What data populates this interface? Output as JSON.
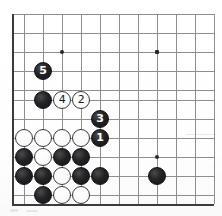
{
  "diagram": {
    "kind": "go-board-diagram",
    "board": {
      "origin_x": 12,
      "origin_y": 14,
      "spacing": 19,
      "cols": 11,
      "rows": 10,
      "left_edge_x": 12,
      "bottom_edge_y": 204,
      "line_color": "#8d8d92",
      "edge_color": "#3b3b3e"
    },
    "star_points": [
      {
        "name": "star-point-upper-left",
        "x": 62,
        "y": 52
      },
      {
        "name": "star-point-upper-right",
        "x": 157,
        "y": 52
      },
      {
        "name": "star-point-lower-right",
        "x": 157,
        "y": 157
      }
    ],
    "grid_lines_h": [
      14,
      33,
      52,
      71,
      90,
      100,
      119,
      138,
      157,
      176,
      195,
      204
    ],
    "grid_lines_v": [
      12,
      24,
      43,
      62,
      81,
      100,
      119,
      138,
      157,
      176,
      195,
      214
    ],
    "numbered_moves": [
      {
        "number": "1",
        "color": "black",
        "x": 100,
        "y": 138,
        "name": "move-1-black"
      },
      {
        "number": "2",
        "color": "white",
        "x": 81,
        "y": 100,
        "name": "move-2-white"
      },
      {
        "number": "3",
        "color": "black",
        "x": 100,
        "y": 119,
        "name": "move-3-black"
      },
      {
        "number": "4",
        "color": "white",
        "x": 62,
        "y": 100,
        "name": "move-4-white"
      },
      {
        "number": "5",
        "color": "black",
        "x": 43,
        "y": 71,
        "name": "move-5-black"
      }
    ],
    "stones": [
      {
        "color": "black",
        "x": 43,
        "y": 100,
        "name": "black-stone"
      },
      {
        "color": "white",
        "x": 24,
        "y": 138,
        "name": "white-stone"
      },
      {
        "color": "white",
        "x": 43,
        "y": 138,
        "name": "white-stone"
      },
      {
        "color": "white",
        "x": 62,
        "y": 138,
        "name": "white-stone"
      },
      {
        "color": "white",
        "x": 81,
        "y": 138,
        "name": "white-stone"
      },
      {
        "color": "black",
        "x": 24,
        "y": 157,
        "name": "black-stone"
      },
      {
        "color": "white",
        "x": 43,
        "y": 157,
        "name": "white-stone"
      },
      {
        "color": "black",
        "x": 62,
        "y": 157,
        "name": "black-stone"
      },
      {
        "color": "black",
        "x": 81,
        "y": 157,
        "name": "black-stone"
      },
      {
        "color": "black",
        "x": 24,
        "y": 176,
        "name": "black-stone"
      },
      {
        "color": "black",
        "x": 43,
        "y": 176,
        "name": "black-stone"
      },
      {
        "color": "white",
        "x": 62,
        "y": 176,
        "name": "white-stone"
      },
      {
        "color": "black",
        "x": 81,
        "y": 176,
        "name": "black-stone"
      },
      {
        "color": "black",
        "x": 100,
        "y": 176,
        "name": "black-stone"
      },
      {
        "color": "black",
        "x": 43,
        "y": 195,
        "name": "black-stone"
      },
      {
        "color": "white",
        "x": 62,
        "y": 195,
        "name": "white-stone"
      },
      {
        "color": "white",
        "x": 81,
        "y": 195,
        "name": "white-stone"
      },
      {
        "color": "black",
        "x": 157,
        "y": 176,
        "name": "black-stone"
      }
    ],
    "colors": {
      "black_stone": "#1a1a1c",
      "white_stone": "#ffffff",
      "grid": "#8d8d92",
      "edge": "#3b3b3e",
      "background": "#fdfdfc"
    }
  }
}
